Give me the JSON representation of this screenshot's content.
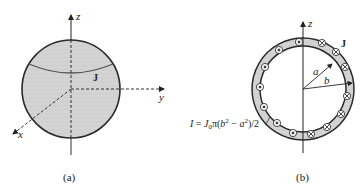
{
  "figure_a": {
    "caption": "(a)",
    "axes": {
      "z": "z",
      "y": "y",
      "x": "x"
    },
    "current_label": "J",
    "sphere_fill": "#d3d3d3",
    "stroke": "#333333"
  },
  "figure_b": {
    "caption": "(b)",
    "axes": {
      "z": "z"
    },
    "current_label": "J",
    "inner_radius_label": "a",
    "outer_radius_label": "b",
    "formula": {
      "lhs": "I",
      "eq": " = ",
      "j": "J",
      "j_sub": "0",
      "pi": "π(",
      "b": "b",
      "sup1": "2",
      "minus": " − ",
      "a": "a",
      "sup2": "2",
      "tail": ")/2"
    },
    "ring_fill": "#d0d0d0",
    "markers": {
      "out_of_page": "dot-in-circle",
      "into_page": "cross-in-circle"
    }
  }
}
